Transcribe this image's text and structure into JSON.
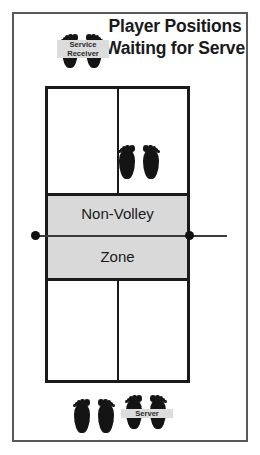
{
  "diagram": {
    "title_line_1": "Player Positions",
    "title_line_2": "Waiting for Serve",
    "court": {
      "non_volley_zone_label_upper": "Non-Volley",
      "non_volley_zone_label_lower": "Zone",
      "non_volley_zone_full_label": "Non-Volley Zone",
      "zone_fill_color": "#d9d9d9",
      "line_color": "#1a1a1a",
      "surface_color": "#ffffff"
    },
    "net": {
      "post_color": "#111111",
      "line_color": "#3a3a3a"
    },
    "players": [
      {
        "id": "service-receiver",
        "label_line_1": "Service",
        "label_line_2": "Receiver",
        "label": "Service Receiver",
        "location": "header-legend"
      },
      {
        "id": "receiver-partner-in-court",
        "label": "",
        "location": "court-top-right-quadrant"
      },
      {
        "id": "server-partner",
        "label": "",
        "location": "behind-baseline-left"
      },
      {
        "id": "server",
        "label": "Server",
        "location": "behind-baseline-right"
      }
    ],
    "icons": {
      "footprints": "footprints-icon"
    },
    "frame_color": "#5a5a5a"
  }
}
